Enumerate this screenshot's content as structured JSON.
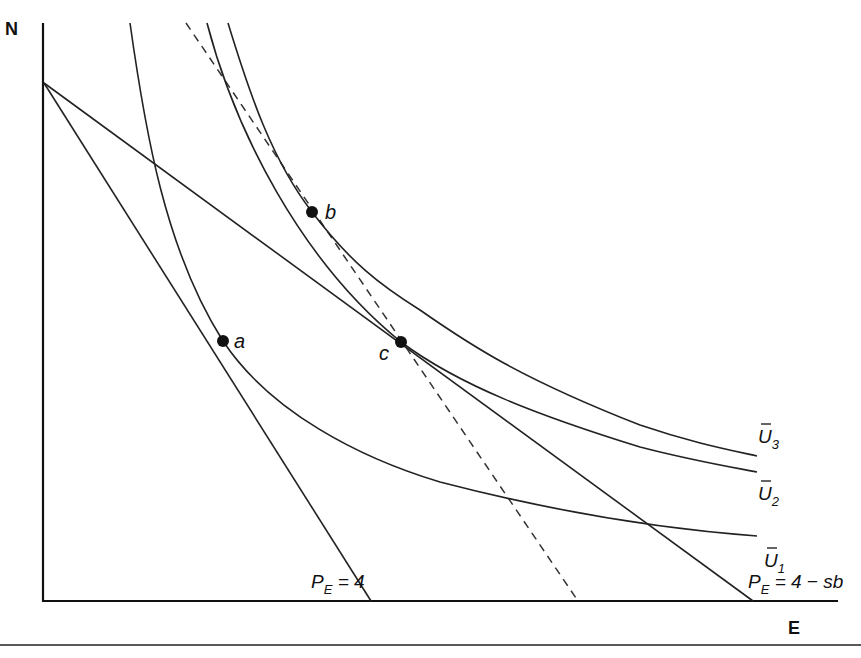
{
  "diagram": {
    "axes": {
      "y_label": "N",
      "x_label": "E"
    },
    "points": [
      {
        "id": "a",
        "label": "a",
        "x": 223,
        "y": 341
      },
      {
        "id": "b",
        "label": "b",
        "x": 312,
        "y": 212
      },
      {
        "id": "c",
        "label": "c",
        "x": 401,
        "y": 342
      }
    ],
    "indifference_curves": [
      {
        "id": "U1",
        "label_main": "U",
        "label_sub": "1",
        "bar": true
      },
      {
        "id": "U2",
        "label_main": "U",
        "label_sub": "2",
        "bar": true
      },
      {
        "id": "U3",
        "label_main": "U",
        "label_sub": "3",
        "bar": true
      }
    ],
    "budget_lines": [
      {
        "id": "budget-original",
        "label_main": "P",
        "label_sub": "E",
        "label_rest": " = 4",
        "style": "solid"
      },
      {
        "id": "budget-subsidized",
        "label_main": "P",
        "label_sub": "E",
        "label_rest": " = 4 − sb",
        "style": "solid"
      },
      {
        "id": "budget-compensated",
        "style": "dashed"
      }
    ]
  }
}
